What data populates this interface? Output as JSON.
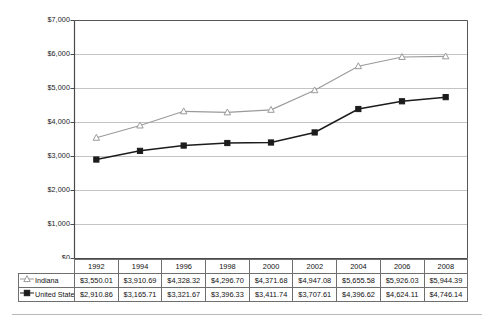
{
  "chart_data": {
    "type": "line",
    "title": "",
    "subtitle": "",
    "xlabel": "",
    "ylabel": "",
    "categories": [
      "1992",
      "1994",
      "1996",
      "1998",
      "2000",
      "2002",
      "2004",
      "2006",
      "2008"
    ],
    "ylim": [
      0,
      7000
    ],
    "ytick_values": [
      0,
      1000,
      2000,
      3000,
      4000,
      5000,
      6000,
      7000
    ],
    "ytick_labels": [
      "$0",
      "$1,000",
      "$2,000",
      "$3,000",
      "$4,000",
      "$5,000",
      "$6,000",
      "$7,000"
    ],
    "grid": "horizontal",
    "legend_position": "table-row-headers",
    "series": [
      {
        "name": "Indiana",
        "marker": "open-triangle",
        "color": "#9a9a9a",
        "values": [
          3550.01,
          3910.69,
          4328.32,
          4296.7,
          4371.68,
          4947.08,
          5655.58,
          5926.03,
          5944.39
        ],
        "labels": [
          "$3,550.01",
          "$3,910.69",
          "$4,328.32",
          "$4,296.70",
          "$4,371.68",
          "$4,947.08",
          "$5,655.58",
          "$5,926.03",
          "$5,944.39"
        ]
      },
      {
        "name": "United States",
        "marker": "filled-square",
        "color": "#1c1c1c",
        "values": [
          2910.86,
          3165.71,
          3321.67,
          3396.33,
          3411.74,
          3707.61,
          4396.62,
          4624.11,
          4746.14
        ],
        "labels": [
          "$2,910.86",
          "$3,165.71",
          "$3,321.67",
          "$3,396.33",
          "$3,411.74",
          "$3,707.61",
          "$4,396.62",
          "$4,624.11",
          "$4,746.14"
        ]
      }
    ]
  },
  "table": {
    "corner_label": "",
    "year_headers": [
      "1992",
      "1994",
      "1996",
      "1998",
      "2000",
      "2002",
      "2004",
      "2006",
      "2008"
    ],
    "rows": [
      {
        "series_label": "Indiana",
        "cells": [
          "$3,550.01",
          "$3,910.69",
          "$4,328.32",
          "$4,296.70",
          "$4,371.68",
          "$4,947.08",
          "$5,655.58",
          "$5,926.03",
          "$5,944.39"
        ]
      },
      {
        "series_label": "United States",
        "cells": [
          "$2,910.86",
          "$3,165.71",
          "$3,321.67",
          "$3,396.33",
          "$3,411.74",
          "$3,707.61",
          "$4,396.62",
          "$4,624.11",
          "$4,746.14"
        ]
      }
    ]
  },
  "colors": {
    "indiana_line": "#9a9a9a",
    "united_states_line": "#1c1c1c",
    "gridline": "#c4c4c4",
    "axis": "#4a4a4a",
    "plot_border": "#555555",
    "table_border": "#6f6f6f"
  }
}
